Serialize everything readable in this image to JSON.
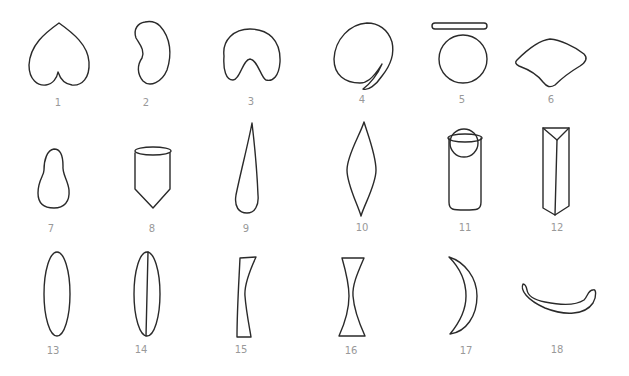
{
  "figure": {
    "stroke_color": "#2a2a2a",
    "label_color": "#999999",
    "shapes": [
      {
        "label": "1",
        "shape": "heart"
      },
      {
        "label": "2",
        "shape": "kidney"
      },
      {
        "label": "3",
        "shape": "horseshoe-blob"
      },
      {
        "label": "4",
        "shape": "circle-with-tail"
      },
      {
        "label": "5",
        "shape": "disc-and-circle"
      },
      {
        "label": "6",
        "shape": "fan"
      },
      {
        "label": "7",
        "shape": "pear"
      },
      {
        "label": "8",
        "shape": "pointed-cylinder"
      },
      {
        "label": "9",
        "shape": "teardrop-narrow"
      },
      {
        "label": "10",
        "shape": "spindle"
      },
      {
        "label": "11",
        "shape": "cylinder-with-sphere"
      },
      {
        "label": "12",
        "shape": "triangular-prism"
      },
      {
        "label": "13",
        "shape": "ellipse"
      },
      {
        "label": "14",
        "shape": "ellipse-split"
      },
      {
        "label": "15",
        "shape": "plano-concave"
      },
      {
        "label": "16",
        "shape": "biconcave"
      },
      {
        "label": "17",
        "shape": "crescent"
      },
      {
        "label": "18",
        "shape": "curved-bar"
      }
    ]
  }
}
